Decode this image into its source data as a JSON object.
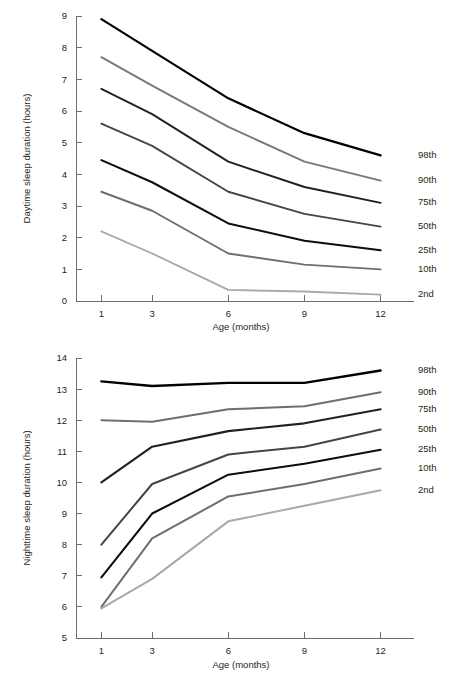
{
  "document": {
    "title": "Sleep duration percentile charts"
  },
  "chart_data": [
    {
      "id": "daytime",
      "type": "line",
      "title": "",
      "xlabel": "Age (months)",
      "ylabel": "Daytime sleep duration (hours)",
      "x": [
        1,
        3,
        6,
        9,
        12
      ],
      "xticklabels": [
        "1",
        "3",
        "6",
        "9",
        "12"
      ],
      "xlim": [
        0,
        13
      ],
      "ylim": [
        0,
        9
      ],
      "yticks": [
        0,
        1,
        2,
        3,
        4,
        5,
        6,
        7,
        8,
        9
      ],
      "yticklabels": [
        "0",
        "1",
        "2",
        "3",
        "4",
        "5",
        "6",
        "7",
        "8",
        "9"
      ],
      "grid": false,
      "legend_position": "right-inline",
      "series": [
        {
          "name": "98th",
          "values": [
            8.9,
            7.9,
            6.4,
            5.3,
            4.6
          ],
          "color": "#000000",
          "width": 2.2
        },
        {
          "name": "90th",
          "values": [
            7.7,
            6.8,
            5.5,
            4.4,
            3.8
          ],
          "color": "#77787b",
          "width": 1.9
        },
        {
          "name": "75th",
          "values": [
            6.7,
            5.9,
            4.4,
            3.6,
            3.1
          ],
          "color": "#231f20",
          "width": 1.9
        },
        {
          "name": "50th",
          "values": [
            5.6,
            4.9,
            3.45,
            2.75,
            2.35
          ],
          "color": "#454447",
          "width": 1.9
        },
        {
          "name": "25th",
          "values": [
            4.45,
            3.75,
            2.45,
            1.9,
            1.6
          ],
          "color": "#0d0d0d",
          "width": 2.0
        },
        {
          "name": "10th",
          "values": [
            3.45,
            2.85,
            1.5,
            1.15,
            1.0
          ],
          "color": "#6d6e71",
          "width": 1.9
        },
        {
          "name": "2nd",
          "values": [
            2.2,
            1.5,
            0.35,
            0.3,
            0.2
          ],
          "color": "#a7a9ac",
          "width": 1.9
        }
      ]
    },
    {
      "id": "nighttime",
      "type": "line",
      "title": "",
      "xlabel": "Age (months)",
      "ylabel": "Nighttime sleep duration (hours)",
      "x": [
        1,
        3,
        6,
        9,
        12
      ],
      "xticklabels": [
        "1",
        "3",
        "6",
        "9",
        "12"
      ],
      "xlim": [
        0,
        13
      ],
      "ylim": [
        5,
        14
      ],
      "yticks": [
        5,
        6,
        7,
        8,
        9,
        10,
        11,
        12,
        13,
        14
      ],
      "yticklabels": [
        "5",
        "6",
        "7",
        "8",
        "9",
        "10",
        "11",
        "12",
        "13",
        "14"
      ],
      "grid": false,
      "legend_position": "right-inline",
      "series": [
        {
          "name": "98th",
          "values": [
            13.25,
            13.1,
            13.2,
            13.2,
            13.6
          ],
          "color": "#000000",
          "width": 2.4
        },
        {
          "name": "90th",
          "values": [
            12.0,
            11.95,
            12.35,
            12.45,
            12.9
          ],
          "color": "#6d6e71",
          "width": 2.0
        },
        {
          "name": "75th",
          "values": [
            10.0,
            11.15,
            11.65,
            11.9,
            12.35
          ],
          "color": "#231f20",
          "width": 2.1
        },
        {
          "name": "50th",
          "values": [
            8.0,
            9.95,
            10.9,
            11.15,
            11.7
          ],
          "color": "#454447",
          "width": 2.0
        },
        {
          "name": "25th",
          "values": [
            6.95,
            9.0,
            10.25,
            10.6,
            11.05
          ],
          "color": "#0d0d0d",
          "width": 2.1
        },
        {
          "name": "10th",
          "values": [
            6.0,
            8.2,
            9.55,
            9.95,
            10.45
          ],
          "color": "#6d6e71",
          "width": 2.0
        },
        {
          "name": "2nd",
          "values": [
            5.95,
            6.9,
            8.75,
            9.25,
            9.75
          ],
          "color": "#a7a9ac",
          "width": 2.0
        }
      ]
    }
  ]
}
